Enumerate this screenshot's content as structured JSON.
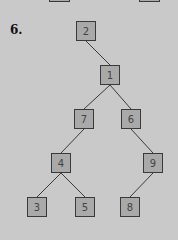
{
  "problem": {
    "number_label": "6."
  },
  "colors": {
    "background": "#c9c9c9",
    "node_fill": "#a9a9a9",
    "node_border": "#3a3a3a",
    "edge": "#3a3a3a"
  },
  "tree": {
    "nodes": [
      {
        "id": "n2",
        "label": "2",
        "x": 76,
        "y": 21
      },
      {
        "id": "n1",
        "label": "1",
        "x": 100,
        "y": 65
      },
      {
        "id": "n7",
        "label": "7",
        "x": 74,
        "y": 109
      },
      {
        "id": "n6",
        "label": "6",
        "x": 121,
        "y": 109
      },
      {
        "id": "n4",
        "label": "4",
        "x": 51,
        "y": 153
      },
      {
        "id": "n9",
        "label": "9",
        "x": 143,
        "y": 153
      },
      {
        "id": "n3",
        "label": "3",
        "x": 27,
        "y": 197
      },
      {
        "id": "n5",
        "label": "5",
        "x": 75,
        "y": 197
      },
      {
        "id": "n8",
        "label": "8",
        "x": 120,
        "y": 197
      }
    ],
    "edges": [
      [
        "2",
        "1"
      ],
      [
        "1",
        "7"
      ],
      [
        "1",
        "6"
      ],
      [
        "7",
        "4"
      ],
      [
        "6",
        "9"
      ],
      [
        "4",
        "3"
      ],
      [
        "4",
        "5"
      ],
      [
        "9",
        "8"
      ]
    ]
  }
}
